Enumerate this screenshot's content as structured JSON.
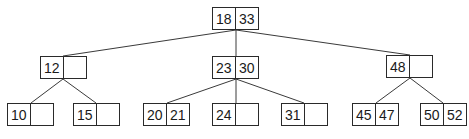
{
  "diagram": {
    "type": "2-3 tree",
    "nodes": [
      {
        "id": "root",
        "keys": [
          "18",
          "33"
        ],
        "x": 212,
        "y": 7,
        "w": 47
      },
      {
        "id": "n12",
        "keys": [
          "12",
          ""
        ],
        "x": 40,
        "y": 56,
        "w": 47
      },
      {
        "id": "n23",
        "keys": [
          "23",
          "30"
        ],
        "x": 212,
        "y": 56,
        "w": 47
      },
      {
        "id": "n48",
        "keys": [
          "48",
          ""
        ],
        "x": 386,
        "y": 55,
        "w": 47
      },
      {
        "id": "n10",
        "keys": [
          "10",
          ""
        ],
        "x": 7,
        "y": 103,
        "w": 47
      },
      {
        "id": "n15",
        "keys": [
          "15",
          ""
        ],
        "x": 73,
        "y": 103,
        "w": 47
      },
      {
        "id": "n20",
        "keys": [
          "20",
          "21"
        ],
        "x": 143,
        "y": 103,
        "w": 47
      },
      {
        "id": "n24",
        "keys": [
          "24",
          ""
        ],
        "x": 212,
        "y": 103,
        "w": 47
      },
      {
        "id": "n31",
        "keys": [
          "31",
          ""
        ],
        "x": 281,
        "y": 103,
        "w": 47
      },
      {
        "id": "n45",
        "keys": [
          "45",
          "47"
        ],
        "x": 352,
        "y": 103,
        "w": 47
      },
      {
        "id": "n50",
        "keys": [
          "50",
          "52"
        ],
        "x": 420,
        "y": 103,
        "w": 47
      }
    ],
    "edges": [
      {
        "from": "root",
        "to": "n12",
        "x1": 236,
        "y1": 30,
        "x2": 63,
        "y2": 56
      },
      {
        "from": "root",
        "to": "n23",
        "x1": 236,
        "y1": 30,
        "x2": 236,
        "y2": 56
      },
      {
        "from": "root",
        "to": "n48",
        "x1": 236,
        "y1": 30,
        "x2": 410,
        "y2": 55
      },
      {
        "from": "n12",
        "to": "n10",
        "x1": 63,
        "y1": 79,
        "x2": 31,
        "y2": 103
      },
      {
        "from": "n12",
        "to": "n15",
        "x1": 63,
        "y1": 79,
        "x2": 96,
        "y2": 103
      },
      {
        "from": "n23",
        "to": "n20",
        "x1": 236,
        "y1": 79,
        "x2": 167,
        "y2": 103
      },
      {
        "from": "n23",
        "to": "n24",
        "x1": 236,
        "y1": 79,
        "x2": 236,
        "y2": 103
      },
      {
        "from": "n23",
        "to": "n31",
        "x1": 236,
        "y1": 79,
        "x2": 304,
        "y2": 103
      },
      {
        "from": "n48",
        "to": "n45",
        "x1": 410,
        "y1": 78,
        "x2": 376,
        "y2": 103
      },
      {
        "from": "n48",
        "to": "n50",
        "x1": 410,
        "y1": 78,
        "x2": 443,
        "y2": 103
      }
    ]
  }
}
